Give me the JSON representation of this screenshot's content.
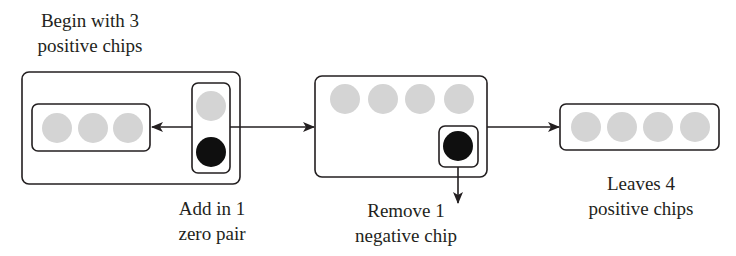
{
  "colors": {
    "positive_chip": "#d4d4d4",
    "negative_chip": "#0f0f0f",
    "stroke": "#231f20",
    "background": "#ffffff"
  },
  "steps": [
    {
      "id": "begin",
      "label_line1": "Begin with 3",
      "label_line2": "positive chips",
      "positive_chips": 3,
      "negative_chips": 0
    },
    {
      "id": "add-zero-pair",
      "label_line1": "Add in 1",
      "label_line2": "zero pair",
      "positive_chips": 1,
      "negative_chips": 1
    },
    {
      "id": "remove-negative",
      "label_line1": "Remove 1",
      "label_line2": "negative chip",
      "positive_chips": 4,
      "negative_chips": 1
    },
    {
      "id": "result",
      "label_line1": "Leaves 4",
      "label_line2": "positive chips",
      "positive_chips": 4,
      "negative_chips": 0
    }
  ]
}
